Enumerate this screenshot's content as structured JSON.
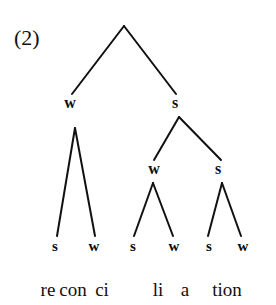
{
  "figure": {
    "example_number": "(2)",
    "word": "reconciliation",
    "line_color": "#111111",
    "background_color": "#ffffff"
  },
  "tree": {
    "root": {
      "label": "",
      "x": 124,
      "y": 26
    },
    "nodes": [
      {
        "id": "n-w-1",
        "label": "w",
        "x": 70,
        "y": 103
      },
      {
        "id": "n-s-1",
        "label": "s",
        "x": 175,
        "y": 103
      },
      {
        "id": "n-w-2",
        "label": "w",
        "x": 154,
        "y": 169
      },
      {
        "id": "n-s-2",
        "label": "s",
        "x": 218,
        "y": 169
      }
    ],
    "leaves": [
      {
        "id": "leaf-1",
        "label": "s",
        "x": 55,
        "y": 246
      },
      {
        "id": "leaf-2",
        "label": "w",
        "x": 94,
        "y": 246
      },
      {
        "id": "leaf-3",
        "label": "s",
        "x": 133,
        "y": 246
      },
      {
        "id": "leaf-4",
        "label": "w",
        "x": 174,
        "y": 246
      },
      {
        "id": "leaf-5",
        "label": "s",
        "x": 209,
        "y": 246
      },
      {
        "id": "leaf-6",
        "label": "w",
        "x": 243,
        "y": 246
      }
    ],
    "edges": [
      {
        "id": "edge-root-w",
        "x1": 124,
        "y1": 26,
        "x2": 72,
        "y2": 94
      },
      {
        "id": "edge-root-s",
        "x1": 124,
        "y1": 26,
        "x2": 176,
        "y2": 94
      },
      {
        "id": "edge-s1-w2",
        "x1": 179,
        "y1": 117,
        "x2": 154,
        "y2": 160
      },
      {
        "id": "edge-s1-s2",
        "x1": 179,
        "y1": 117,
        "x2": 221,
        "y2": 160
      },
      {
        "id": "edge-w1-l1",
        "x1": 75,
        "y1": 128,
        "x2": 57,
        "y2": 236
      },
      {
        "id": "edge-w1-l2",
        "x1": 75,
        "y1": 128,
        "x2": 95,
        "y2": 236
      },
      {
        "id": "edge-w2-l3",
        "x1": 153,
        "y1": 183,
        "x2": 134,
        "y2": 236
      },
      {
        "id": "edge-w2-l4",
        "x1": 153,
        "y1": 183,
        "x2": 173,
        "y2": 236
      },
      {
        "id": "edge-s2-l5",
        "x1": 222,
        "y1": 183,
        "x2": 208,
        "y2": 236
      },
      {
        "id": "edge-s2-l6",
        "x1": 222,
        "y1": 183,
        "x2": 241,
        "y2": 236
      }
    ]
  },
  "syllables": [
    {
      "id": "syl-re",
      "text": "re",
      "x": 48,
      "y": 289
    },
    {
      "id": "syl-con",
      "text": "con",
      "x": 73,
      "y": 289
    },
    {
      "id": "syl-ci",
      "text": "ci",
      "x": 102,
      "y": 289
    },
    {
      "id": "syl-li",
      "text": "li",
      "x": 158,
      "y": 289
    },
    {
      "id": "syl-a",
      "text": "a",
      "x": 185,
      "y": 289
    },
    {
      "id": "syl-tion",
      "text": "tion",
      "x": 227,
      "y": 289
    }
  ]
}
